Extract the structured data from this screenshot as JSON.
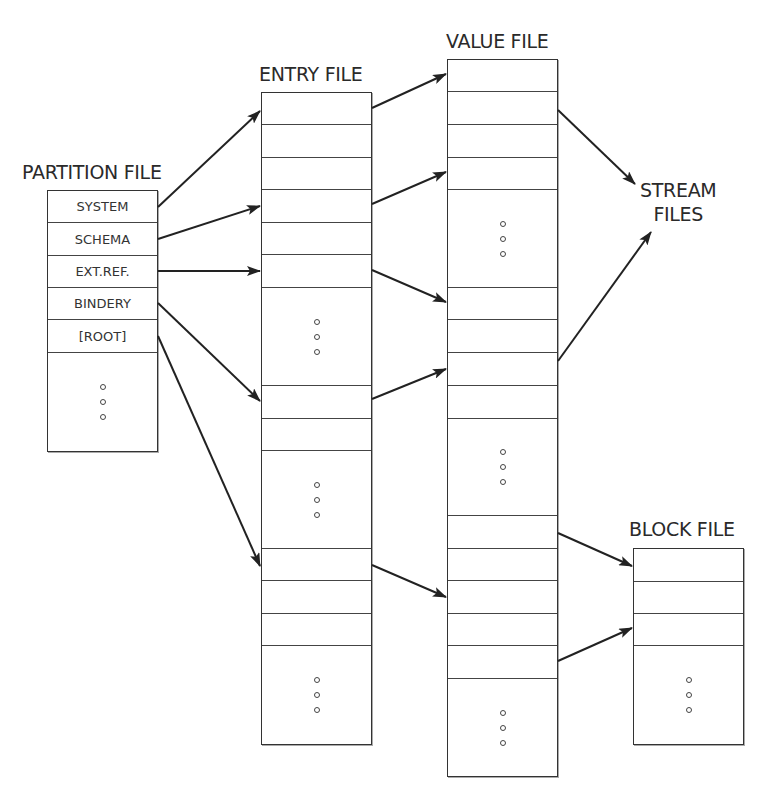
{
  "title_labels": {
    "partition": "PARTITION FILE",
    "entry": "ENTRY FILE",
    "value": "VALUE FILE",
    "stream_line1": "STREAM",
    "stream_line2": "FILES",
    "block": "BLOCK FILE"
  },
  "partition_file": {
    "entries": [
      "SYSTEM",
      "SCHEMA",
      "EXT.REF.",
      "BINDERY",
      "[ROOT]"
    ],
    "ellipsis": "vertical-dots"
  },
  "colors": {
    "line": "#333333",
    "text": "#2a2a2a",
    "background": "#ffffff"
  },
  "arrows": [
    {
      "from": "partition.SYSTEM",
      "to": "entry.record1"
    },
    {
      "from": "partition.SCHEMA",
      "to": "entry.record4"
    },
    {
      "from": "partition.EXT.REF.",
      "to": "entry.record6"
    },
    {
      "from": "partition.BINDERY",
      "to": "entry.group2.record1"
    },
    {
      "from": "partition.[ROOT]",
      "to": "entry.group3.record1"
    },
    {
      "from": "entry.record1",
      "to": "value.record1"
    },
    {
      "from": "entry.record4",
      "to": "value.record4"
    },
    {
      "from": "entry.record6",
      "to": "value.group2.record1"
    },
    {
      "from": "entry.group2.record1",
      "to": "value.group2.record3"
    },
    {
      "from": "entry.group3.record1",
      "to": "value.group3.record3"
    },
    {
      "from": "value.record2",
      "to": "stream_files"
    },
    {
      "from": "value.group2.record3",
      "to": "stream_files"
    },
    {
      "from": "value.group3.record1",
      "to": "block.record1"
    },
    {
      "from": "value.group3.record5",
      "to": "block.record3"
    }
  ]
}
